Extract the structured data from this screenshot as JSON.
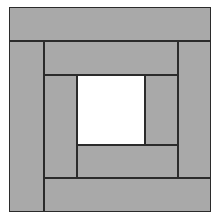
{
  "diagram": {
    "colors": {
      "fill": "#a9a9a9",
      "center": "#ffffff",
      "stroke": "#2b2b2b"
    },
    "pieces": [
      {
        "name": "outer-top-strip",
        "x": 9,
        "y": 7,
        "w": 202,
        "h": 34,
        "fill": "#a9a9a9"
      },
      {
        "name": "outer-left-strip",
        "x": 9,
        "y": 41,
        "w": 35,
        "h": 171,
        "fill": "#a9a9a9"
      },
      {
        "name": "outer-bottom-strip",
        "x": 44,
        "y": 178,
        "w": 167,
        "h": 34,
        "fill": "#a9a9a9"
      },
      {
        "name": "outer-right-strip",
        "x": 178,
        "y": 41,
        "w": 33,
        "h": 137,
        "fill": "#a9a9a9"
      },
      {
        "name": "inner-top-strip",
        "x": 44,
        "y": 41,
        "w": 134,
        "h": 34,
        "fill": "#a9a9a9"
      },
      {
        "name": "inner-left-strip",
        "x": 44,
        "y": 75,
        "w": 33,
        "h": 103,
        "fill": "#a9a9a9"
      },
      {
        "name": "inner-bottom-strip",
        "x": 77,
        "y": 145,
        "w": 101,
        "h": 33,
        "fill": "#a9a9a9"
      },
      {
        "name": "inner-right-strip",
        "x": 145,
        "y": 75,
        "w": 33,
        "h": 70,
        "fill": "#a9a9a9"
      },
      {
        "name": "center-square",
        "x": 77,
        "y": 75,
        "w": 68,
        "h": 70,
        "fill": "#ffffff"
      }
    ]
  }
}
